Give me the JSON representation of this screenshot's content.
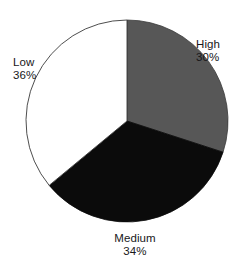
{
  "chart_data": {
    "type": "pie",
    "title": "",
    "subtitle": "",
    "xlabel": "",
    "ylabel": "",
    "legend_position": "none",
    "grid": false,
    "labels_position": "outside",
    "start_angle_deg": 0,
    "direction": "clockwise",
    "categories": [
      "High",
      "Medium",
      "Low"
    ],
    "values": [
      30,
      34,
      36
    ],
    "unit": "%",
    "slices": [
      {
        "name": "High",
        "value": 30,
        "value_label": "30%",
        "color": "#575757",
        "start_angle_deg": 0,
        "end_angle_deg": 108,
        "label_position": "right"
      },
      {
        "name": "Medium",
        "value": 34,
        "value_label": "34%",
        "color": "#0b0b0b",
        "start_angle_deg": 108,
        "end_angle_deg": 230.4,
        "label_position": "bottom"
      },
      {
        "name": "Low",
        "value": 36,
        "value_label": "36%",
        "color": "#ffffff",
        "start_angle_deg": 230.4,
        "end_angle_deg": 360,
        "label_position": "left"
      }
    ],
    "geometry": {
      "center_x": 127,
      "center_y": 121,
      "radius": 101
    },
    "colors": {
      "background": "#ffffff",
      "outline": "#3a3a3a",
      "text": "#18181a",
      "high": "#575757",
      "medium": "#0b0b0b",
      "low": "#ffffff"
    }
  },
  "labels": {
    "high": {
      "name": "High",
      "value": "30%"
    },
    "medium": {
      "name": "Medium",
      "value": "34%"
    },
    "low": {
      "name": "Low",
      "value": "36%"
    }
  }
}
